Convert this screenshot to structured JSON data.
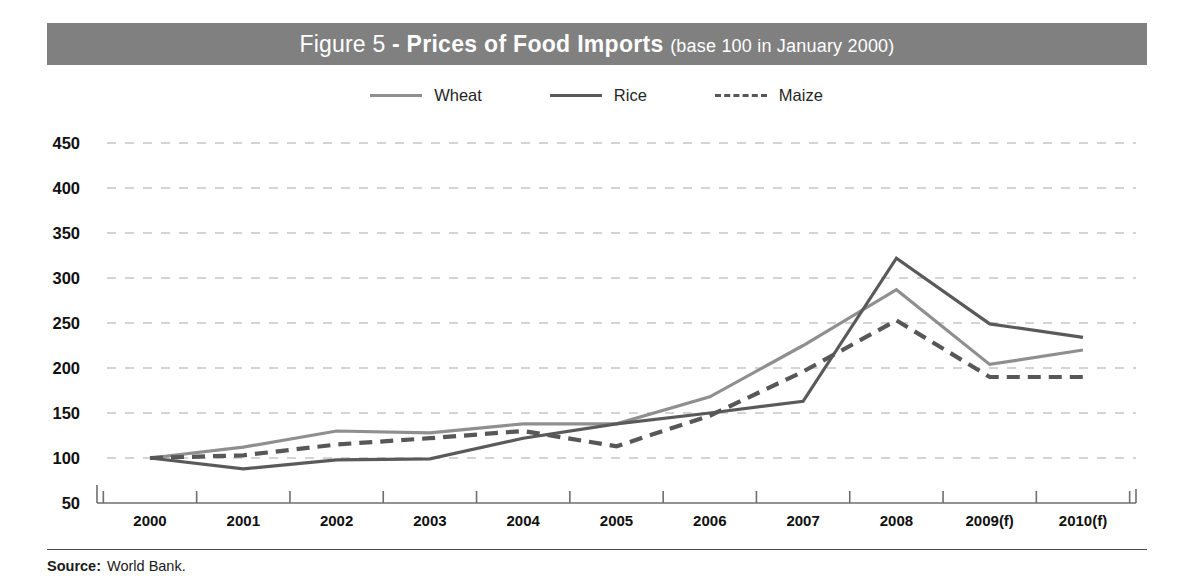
{
  "figure": {
    "label": "Figure 5",
    "separator": " - ",
    "title": "Prices of Food Imports",
    "subtitle": "(base 100 in January 2000)",
    "header_bg": "#808080",
    "header_text_color": "#ffffff"
  },
  "legend": {
    "position": "top-center",
    "items": [
      {
        "label": "Wheat",
        "color": "#8f8f8f",
        "style": "solid"
      },
      {
        "label": "Rice",
        "color": "#5a5a5a",
        "style": "solid"
      },
      {
        "label": "Maize",
        "color": "#575757",
        "style": "dashed"
      }
    ]
  },
  "source": {
    "label": "Source:",
    "value": "World Bank."
  },
  "axes": {
    "y_ticks": [
      "450",
      "400",
      "350",
      "300",
      "250",
      "200",
      "150",
      "100",
      "50"
    ],
    "x_ticks": [
      "2000",
      "2001",
      "2002",
      "2003",
      "2004",
      "2005",
      "2006",
      "2007",
      "2008",
      "2009(f)",
      "2010(f)"
    ]
  },
  "chart_data": {
    "type": "line",
    "title": "Prices of Food Imports",
    "subtitle": "(base 100 in January 2000)",
    "xlabel": "",
    "ylabel": "",
    "ylim": [
      50,
      450
    ],
    "ytick_step": 50,
    "grid": "horizontal-dashed",
    "legend_position": "top-center",
    "categories": [
      "2000",
      "2001",
      "2002",
      "2003",
      "2004",
      "2005",
      "2006",
      "2007",
      "2008",
      "2009(f)",
      "2010(f)"
    ],
    "series": [
      {
        "name": "Wheat",
        "color": "#8f8f8f",
        "style": "solid",
        "values": [
          100,
          112,
          130,
          128,
          138,
          138,
          168,
          225,
          287,
          204,
          220
        ]
      },
      {
        "name": "Rice",
        "color": "#5a5a5a",
        "style": "solid",
        "values": [
          100,
          88,
          98,
          99,
          122,
          138,
          150,
          163,
          322,
          249,
          234
        ]
      },
      {
        "name": "Maize",
        "color": "#575757",
        "style": "dashed",
        "values": [
          100,
          103,
          115,
          122,
          130,
          113,
          147,
          196,
          253,
          190,
          190
        ]
      }
    ],
    "annotations": [
      "Source: World Bank."
    ]
  }
}
